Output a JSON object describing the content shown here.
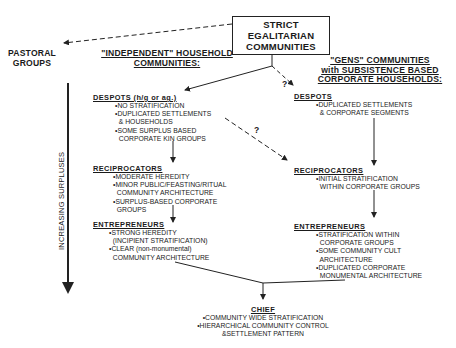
{
  "root": {
    "line1": "STRICT EGALITARIAN",
    "line2": "COMMUNITIES"
  },
  "pastoral": {
    "line1": "PASTORAL",
    "line2": "GROUPS"
  },
  "left_header": {
    "line1": "\"INDEPENDENT\" HOUSEHOLD",
    "line2": "COMMUNITIES:"
  },
  "right_header": {
    "line1": "\"GENS\" COMMUNITIES",
    "line2": "with SUBSISTENCE BASED",
    "line3": "CORPORATE HOUSEHOLDS:"
  },
  "axis_label": "INCREASING SURPLUSES",
  "question_mark": "?",
  "left": {
    "despots": {
      "title": "DESPOTS (h/g or ag.)",
      "items": [
        "•NO STRATIFICATION",
        "•DUPLICATED SETTLEMENTS",
        "  & HOUSEHOLDS",
        "•SOME SURPLUS BASED",
        "  CORPORATE KIN GROUPS"
      ]
    },
    "reciprocators": {
      "title": "RECIPROCATORS",
      "items": [
        "•MODERATE HEREDITY",
        "•MINOR PUBLIC/FEASTING/RITUAL",
        "  COMMUNITY ARCHITECTURE",
        "•SURPLUS-BASED CORPORATE",
        "  GROUPS"
      ]
    },
    "entrepreneurs": {
      "title": "ENTREPRENEURS",
      "items": [
        "•STRONG HEREDITY",
        "  (INCIPIENT STRATIFICATION)",
        "•CLEAR (non-monumental)",
        "  COMMUNITY ARCHITECTURE"
      ]
    }
  },
  "right": {
    "despots": {
      "title": "DESPOTS",
      "items": [
        "•DUPLICATED SETTLEMENTS",
        "  & CORPORATE SEGMENTS"
      ]
    },
    "reciprocators": {
      "title": "RECIPROCATORS",
      "items": [
        "•INITIAL STRATIFICATION",
        "  WITHIN CORPORATE GROUPS"
      ]
    },
    "entrepreneurs": {
      "title": "ENTREPRENEURS",
      "items": [
        "•STRATIFICATION WITHIN",
        "  CORPORATE GROUPS",
        "•SOME COMMUNITY CULT",
        "  ARCHITECTURE",
        "•DUPLICATED CORPORATE",
        "  MONUMENTAL ARCHITECTURE"
      ]
    }
  },
  "chief": {
    "title": "CHIEF",
    "items": [
      "•COMMUNITY WIDE STRATIFICATION",
      "•HIERARCHICAL COMMUNITY CONTROL",
      "&SETTLEMENT PATTERN"
    ]
  }
}
